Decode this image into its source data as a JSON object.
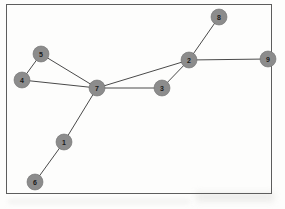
{
  "figure": {
    "kind": "node-link-graph",
    "border_color": "#5d5d5d",
    "background_color": "#fdfdfc",
    "node_fill_color": "#8c8c8c",
    "node_stroke_color": "#6f6f6f",
    "edge_color": "#4a4a4a",
    "label_color": "#1a1a1a",
    "node_radius": 8
  },
  "chart_data": {
    "type": "graph",
    "title": "",
    "xlabel": "",
    "ylabel": "",
    "directed": false,
    "weighted": false,
    "node_count": 9,
    "edge_count": 10,
    "nodes": [
      {
        "id": "1",
        "label": "1",
        "x": 64,
        "y": 142
      },
      {
        "id": "2",
        "label": "2",
        "x": 189,
        "y": 60
      },
      {
        "id": "3",
        "label": "3",
        "x": 162,
        "y": 88
      },
      {
        "id": "4",
        "label": "4",
        "x": 22,
        "y": 80
      },
      {
        "id": "5",
        "label": "5",
        "x": 41,
        "y": 54
      },
      {
        "id": "6",
        "label": "6",
        "x": 35,
        "y": 182
      },
      {
        "id": "7",
        "label": "7",
        "x": 97,
        "y": 88
      },
      {
        "id": "8",
        "label": "8",
        "x": 219,
        "y": 17
      },
      {
        "id": "9",
        "label": "9",
        "x": 268,
        "y": 59
      }
    ],
    "edges": [
      {
        "source": "4",
        "target": "5"
      },
      {
        "source": "4",
        "target": "7"
      },
      {
        "source": "5",
        "target": "7"
      },
      {
        "source": "7",
        "target": "1"
      },
      {
        "source": "7",
        "target": "3"
      },
      {
        "source": "7",
        "target": "2"
      },
      {
        "source": "1",
        "target": "6"
      },
      {
        "source": "3",
        "target": "2"
      },
      {
        "source": "2",
        "target": "8"
      },
      {
        "source": "2",
        "target": "9"
      }
    ]
  }
}
